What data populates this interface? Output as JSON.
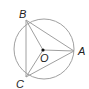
{
  "diagram": {
    "type": "inscribed-triangle-in-circle",
    "circle": {
      "center": "O",
      "cx": 44,
      "cy": 49,
      "r": 30
    },
    "points": {
      "A": {
        "label": "A",
        "x": 74,
        "y": 51
      },
      "B": {
        "label": "B",
        "x": 26,
        "y": 20
      },
      "C": {
        "label": "C",
        "x": 26,
        "y": 77
      },
      "O": {
        "label": "O",
        "x": 43,
        "y": 50
      }
    },
    "segments": [
      "AB",
      "BC",
      "CA",
      "OA",
      "OB",
      "OC"
    ],
    "colors": {
      "stroke": "#a0a0a0",
      "text": "#222222",
      "dot": "#111111"
    }
  }
}
